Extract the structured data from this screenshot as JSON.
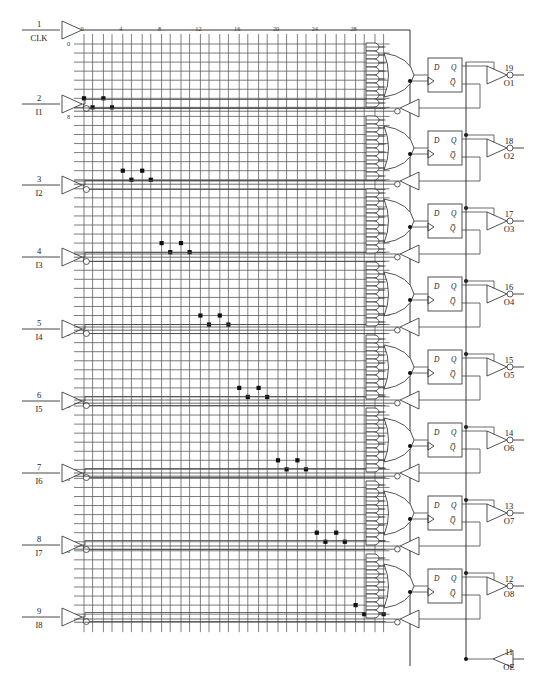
{
  "diagram": {
    "type": "pal-gal-fuse-map",
    "device_style": "16V8 registered",
    "canvas": {
      "width": 546,
      "height": 698
    }
  },
  "colors": {
    "ink": "#1a1a1a",
    "wire": "#444444",
    "grid": "#555555",
    "fuse": "#111111",
    "background": "#ffffff"
  },
  "array": {
    "origin_x": 84,
    "origin_y": 44,
    "col_count": 32,
    "col_pitch": 8.6,
    "col_pair_gap": 2.2,
    "row_count": 64,
    "row_pitch": 9.05,
    "row_labels": [
      "0",
      "8",
      "16",
      "24",
      "32",
      "40",
      "48",
      "56",
      "63"
    ],
    "row_label_rows": [
      0,
      8,
      16,
      24,
      32,
      40,
      48,
      56,
      63
    ],
    "col_labels": [
      "0",
      "4",
      "8",
      "12",
      "16",
      "20",
      "24",
      "28"
    ],
    "col_label_cols": [
      0,
      4,
      8,
      12,
      16,
      20,
      24,
      28
    ]
  },
  "inputs": {
    "label_clk": "CLK",
    "pins": [
      {
        "num": "1",
        "name": "CLK",
        "y": 30,
        "inverting": false
      },
      {
        "num": "2",
        "name": "I1",
        "y": 104,
        "inverting": true
      },
      {
        "num": "3",
        "name": "I2",
        "y": 185,
        "inverting": true
      },
      {
        "num": "4",
        "name": "I3",
        "y": 257,
        "inverting": true
      },
      {
        "num": "5",
        "name": "I4",
        "y": 329,
        "inverting": true
      },
      {
        "num": "6",
        "name": "I5",
        "y": 401,
        "inverting": true
      },
      {
        "num": "7",
        "name": "I6",
        "y": 473,
        "inverting": true
      },
      {
        "num": "8",
        "name": "I7",
        "y": 545,
        "inverting": true
      },
      {
        "num": "9",
        "name": "I8",
        "y": 617,
        "inverting": true
      }
    ]
  },
  "outputs": {
    "pins": [
      {
        "num": "19",
        "name": "O1",
        "y": 75
      },
      {
        "num": "18",
        "name": "O2",
        "y": 148
      },
      {
        "num": "17",
        "name": "O3",
        "y": 221
      },
      {
        "num": "16",
        "name": "O4",
        "y": 294
      },
      {
        "num": "15",
        "name": "O5",
        "y": 367
      },
      {
        "num": "14",
        "name": "O6",
        "y": 440
      },
      {
        "num": "13",
        "name": "O7",
        "y": 513
      },
      {
        "num": "12",
        "name": "O8",
        "y": 586
      }
    ],
    "oe_pin": {
      "num": "11",
      "name": "OE",
      "y": 659
    }
  },
  "macrocells": [
    {
      "index": 1,
      "and_count": 8,
      "ff_labels": {
        "d": "D",
        "q": "Q",
        "qbar": "Q̅"
      },
      "output": "O1"
    },
    {
      "index": 2,
      "and_count": 8,
      "ff_labels": {
        "d": "D",
        "q": "Q",
        "qbar": "Q̅"
      },
      "output": "O2"
    },
    {
      "index": 3,
      "and_count": 8,
      "ff_labels": {
        "d": "D",
        "q": "Q",
        "qbar": "Q̅"
      },
      "output": "O3"
    },
    {
      "index": 4,
      "and_count": 8,
      "ff_labels": {
        "d": "D",
        "q": "Q",
        "qbar": "Q̅"
      },
      "output": "O4"
    },
    {
      "index": 5,
      "and_count": 8,
      "ff_labels": {
        "d": "D",
        "q": "Q",
        "qbar": "Q̅"
      },
      "output": "O5"
    },
    {
      "index": 6,
      "and_count": 8,
      "ff_labels": {
        "d": "D",
        "q": "Q",
        "qbar": "Q̅"
      },
      "output": "O6"
    },
    {
      "index": 7,
      "and_count": 8,
      "ff_labels": {
        "d": "D",
        "q": "Q",
        "qbar": "Q̅"
      },
      "output": "O7"
    },
    {
      "index": 8,
      "and_count": 8,
      "ff_labels": {
        "d": "D",
        "q": "Q",
        "qbar": "Q̅"
      },
      "output": "O8"
    }
  ],
  "fuses": [
    {
      "row": 7,
      "col": 0
    },
    {
      "row": 7,
      "col": 2
    },
    {
      "row": 8,
      "col": 1
    },
    {
      "row": 8,
      "col": 3
    },
    {
      "row": 15,
      "col": 4
    },
    {
      "row": 15,
      "col": 6
    },
    {
      "row": 16,
      "col": 5
    },
    {
      "row": 16,
      "col": 7
    },
    {
      "row": 23,
      "col": 8
    },
    {
      "row": 23,
      "col": 10
    },
    {
      "row": 24,
      "col": 9
    },
    {
      "row": 24,
      "col": 11
    },
    {
      "row": 31,
      "col": 12
    },
    {
      "row": 31,
      "col": 14
    },
    {
      "row": 32,
      "col": 13
    },
    {
      "row": 32,
      "col": 15
    },
    {
      "row": 39,
      "col": 16
    },
    {
      "row": 39,
      "col": 18
    },
    {
      "row": 40,
      "col": 17
    },
    {
      "row": 40,
      "col": 19
    },
    {
      "row": 47,
      "col": 20
    },
    {
      "row": 47,
      "col": 22
    },
    {
      "row": 48,
      "col": 21
    },
    {
      "row": 48,
      "col": 23
    },
    {
      "row": 55,
      "col": 24
    },
    {
      "row": 55,
      "col": 26
    },
    {
      "row": 56,
      "col": 25
    },
    {
      "row": 56,
      "col": 27
    },
    {
      "row": 63,
      "col": 28
    },
    {
      "row": 63,
      "col": 30
    },
    {
      "row": 64,
      "col": 29
    },
    {
      "row": 64,
      "col": 31
    }
  ]
}
